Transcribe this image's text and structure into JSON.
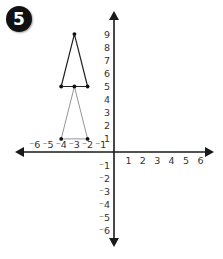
{
  "problem": {
    "number": "5"
  },
  "colors": {
    "axis": "#1a1a1a",
    "triangle_upper": "#222222",
    "triangle_lower": "#888888",
    "point": "#111111",
    "label": "#333333"
  },
  "chart_data": {
    "type": "diagram",
    "title": "",
    "axes": {
      "x_ticks": [
        -6,
        -5,
        -4,
        -3,
        -2,
        -1,
        1,
        2,
        3,
        4,
        5,
        6
      ],
      "y_ticks": [
        9,
        8,
        7,
        6,
        5,
        4,
        3,
        2,
        1,
        -1,
        -2,
        -3,
        -4,
        -5,
        -6
      ],
      "x_range": [
        -6.5,
        6.8
      ],
      "y_range": [
        -6.8,
        10.2
      ],
      "arrows": true,
      "grid": false
    },
    "shapes": [
      {
        "name": "upper-triangle",
        "vertices": [
          [
            -3,
            9
          ],
          [
            -4,
            5
          ],
          [
            -2,
            5
          ]
        ],
        "style": "dark"
      },
      {
        "name": "lower-triangle",
        "vertices": [
          [
            -3,
            5
          ],
          [
            -4,
            1
          ],
          [
            -2,
            1
          ]
        ],
        "style": "light"
      }
    ],
    "points": [
      [
        -3,
        9
      ],
      [
        -4,
        5
      ],
      [
        -3,
        5
      ],
      [
        -2,
        5
      ],
      [
        -4,
        1
      ],
      [
        -2,
        1
      ]
    ]
  }
}
